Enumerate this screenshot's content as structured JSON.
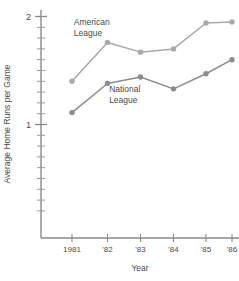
{
  "chart_data": {
    "type": "line",
    "title": "",
    "xlabel": "Year",
    "ylabel": "Average Home Runs per Game",
    "categories": [
      "1981",
      "'82",
      "'83",
      "'84",
      "'85",
      "'86"
    ],
    "x_tick_labels": [
      "1981",
      "'82",
      "'83",
      "'84",
      "'85",
      "'86"
    ],
    "y_tick_labels": [
      "2",
      "1"
    ],
    "y_major_ticks": [
      1,
      2
    ],
    "ylim": [
      0.2,
      2.05
    ],
    "xlim": [
      1980.6,
      1986.4
    ],
    "grid": false,
    "legend": "inline-annotations",
    "minor_tick_step": 0.1,
    "series": [
      {
        "name": "American League",
        "color": "#a9a9a9",
        "values": [
          1.4,
          1.76,
          1.67,
          1.7,
          1.94,
          1.95
        ]
      },
      {
        "name": "National League",
        "color": "#8c8c8c",
        "values": [
          1.11,
          1.38,
          1.44,
          1.33,
          1.47,
          1.6
        ]
      }
    ],
    "annotations": [
      {
        "name": "american-league",
        "text_lines": [
          "American",
          "League"
        ],
        "x": 1981.05,
        "y": 1.92
      },
      {
        "name": "national-league",
        "text_lines": [
          "National",
          "League"
        ],
        "x": 1982.05,
        "y": 1.3
      }
    ]
  },
  "colors": {
    "axis": "#8a8a8a",
    "text": "#4a4a4a",
    "american_league": "#a9a9a9",
    "national_league": "#8c8c8c",
    "background": "#ffffff"
  }
}
